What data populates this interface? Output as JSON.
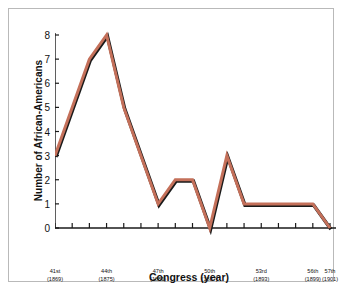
{
  "chart_data": {
    "type": "line",
    "title": "",
    "xlabel": "Congress (year)",
    "ylabel": "Number of African-Americans",
    "ylim": [
      0,
      8
    ],
    "yticks": [
      0,
      1,
      2,
      3,
      4,
      5,
      6,
      7,
      8
    ],
    "grid": false,
    "legend": null,
    "line_color": "#c4705a",
    "shadow_color": "#1a1a1a",
    "x": [
      41,
      42,
      43,
      44,
      45,
      46,
      47,
      48,
      49,
      50,
      51,
      52,
      53,
      54,
      55,
      56,
      57
    ],
    "categories": [
      "41st",
      "42nd",
      "43rd",
      "44th",
      "45th",
      "46th",
      "47th",
      "48th",
      "49th",
      "50th",
      "51st",
      "52nd",
      "53rd",
      "54th",
      "55th",
      "56th",
      "57th"
    ],
    "values": [
      3,
      5,
      7,
      8,
      5,
      3,
      1,
      2,
      2,
      0,
      3,
      1,
      1,
      1,
      1,
      1,
      0
    ],
    "xtick_labels": [
      {
        "congress": "41st",
        "year": "(1869)",
        "x": 41
      },
      {
        "congress": "44th",
        "year": "(1875)",
        "x": 44
      },
      {
        "congress": "47th",
        "year": "(1881)",
        "x": 47
      },
      {
        "congress": "50th",
        "year": "(1887)",
        "x": 50
      },
      {
        "congress": "53rd",
        "year": "(1893)",
        "x": 53
      },
      {
        "congress": "56th",
        "year": "(1899)",
        "x": 56
      },
      {
        "congress": "57th",
        "year": "(1901)",
        "x": 57
      }
    ]
  },
  "axis": {
    "y_labels": [
      "8",
      "7",
      "6",
      "5",
      "4",
      "3",
      "2",
      "1",
      "0"
    ]
  }
}
